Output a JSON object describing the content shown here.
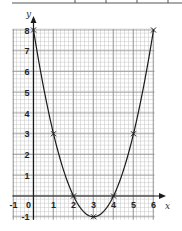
{
  "chart_data": {
    "type": "line",
    "title": "",
    "xlabel": "x",
    "ylabel": "y",
    "xlim": [
      -1,
      6
    ],
    "ylim": [
      -1,
      8
    ],
    "grid": true,
    "x_ticks": [
      "-1",
      "0",
      "1",
      "2",
      "3",
      "4",
      "5",
      "6"
    ],
    "y_ticks": [
      "8",
      "7",
      "6",
      "5",
      "4",
      "3",
      "2",
      "1",
      "-1"
    ],
    "series": [
      {
        "name": "y = x^2 - 6x + 8",
        "x": [
          0,
          1,
          2,
          3,
          4,
          5,
          6
        ],
        "y": [
          8,
          3,
          0,
          -1,
          0,
          3,
          8
        ],
        "marker": "x",
        "curve": "smooth"
      }
    ],
    "colors": {
      "grid_minor": "#c4c4c4",
      "grid_major": "#8c8c8c",
      "axis": "#1a1a1a",
      "curve": "#1a1a1a",
      "top_table_line": "#555555"
    }
  }
}
